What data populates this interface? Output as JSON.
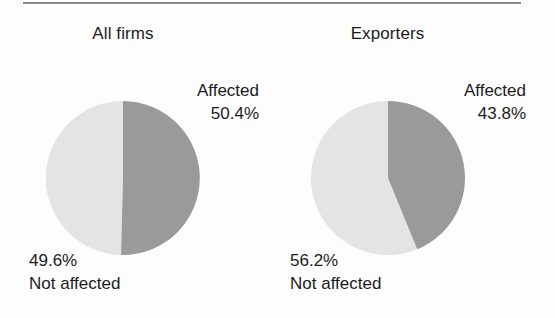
{
  "figure": {
    "background_color": "#fdfdfd",
    "rule_color": "#6f6f6f",
    "affected_color": "#9a9a9a",
    "not_affected_color": "#e4e4e4"
  },
  "chart_data": [
    {
      "type": "pie",
      "title": "All firms",
      "categories": [
        "Affected",
        "Not affected"
      ],
      "values": [
        50.4,
        49.6
      ],
      "value_labels": [
        "50.4%",
        "49.6%"
      ],
      "colors": [
        "#9a9a9a",
        "#e4e4e4"
      ],
      "start_angle_deg": 0,
      "direction": "clockwise",
      "legend": "none",
      "grid": false,
      "annotations": [
        {
          "text": "Affected",
          "value": "50.4%",
          "position": "upper-right"
        },
        {
          "text": "Not affected",
          "value": "49.6%",
          "position": "lower-left"
        }
      ]
    },
    {
      "type": "pie",
      "title": "Exporters",
      "categories": [
        "Affected",
        "Not affected"
      ],
      "values": [
        43.8,
        56.2
      ],
      "value_labels": [
        "43.8%",
        "56.2%"
      ],
      "colors": [
        "#9a9a9a",
        "#e4e4e4"
      ],
      "start_angle_deg": 0,
      "direction": "clockwise",
      "legend": "none",
      "grid": false,
      "annotations": [
        {
          "text": "Affected",
          "value": "43.8%",
          "position": "upper-right"
        },
        {
          "text": "Not affected",
          "value": "56.2%",
          "position": "lower-left"
        }
      ]
    }
  ],
  "panels": [
    {
      "title": "All firms",
      "affected_label": "Affected",
      "affected_value": "50.4%",
      "not_affected_value": "49.6%",
      "not_affected_label": "Not affected"
    },
    {
      "title": "Exporters",
      "affected_label": "Affected",
      "affected_value": "43.8%",
      "not_affected_value": "56.2%",
      "not_affected_label": "Not affected"
    }
  ]
}
